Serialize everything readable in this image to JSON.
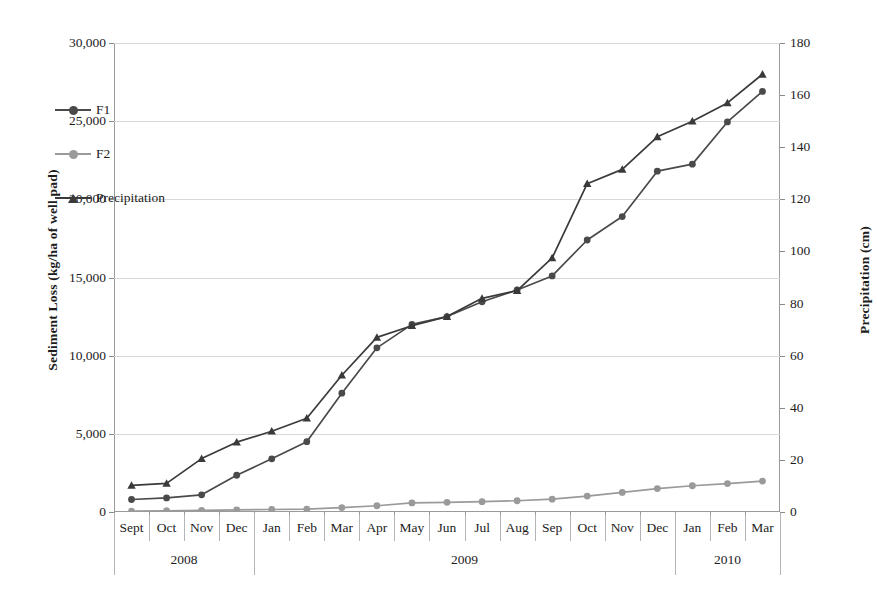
{
  "chart_data": {
    "type": "line",
    "title": "",
    "xlabel": "",
    "ylabel": "Sediment Loss (kg/ha of well pad)",
    "y2label": "Precipitation (cm)",
    "ylim": [
      0,
      30000
    ],
    "y2lim": [
      0,
      180
    ],
    "grid": true,
    "legend_position": "upper-left-inside",
    "categories": [
      "Sept",
      "Oct",
      "Nov",
      "Dec",
      "Jan",
      "Feb",
      "Mar",
      "Apr",
      "May",
      "Jun",
      "Jul",
      "Aug",
      "Sep",
      "Oct",
      "Nov",
      "Dec",
      "Jan",
      "Feb",
      "Mar"
    ],
    "year_groups": [
      {
        "label": "2008",
        "start": 0,
        "end": 3
      },
      {
        "label": "2009",
        "start": 4,
        "end": 15
      },
      {
        "label": "2010",
        "start": 16,
        "end": 18
      }
    ],
    "yticks": [
      "0",
      "5,000",
      "10,000",
      "15,000",
      "20,000",
      "25,000",
      "30,000"
    ],
    "ytick_values": [
      0,
      5000,
      10000,
      15000,
      20000,
      25000,
      30000
    ],
    "y2ticks": [
      "0",
      "20",
      "40",
      "60",
      "80",
      "100",
      "120",
      "140",
      "160",
      "180"
    ],
    "y2tick_values": [
      0,
      20,
      40,
      60,
      80,
      100,
      120,
      140,
      160,
      180
    ],
    "series": [
      {
        "name": "F1",
        "axis": "left",
        "marker": "circle",
        "color": "#4a4a4a",
        "values": [
          800,
          900,
          1100,
          2350,
          3400,
          4500,
          7600,
          10500,
          12000,
          12500,
          13450,
          14200,
          15100,
          17400,
          18900,
          21800,
          22250,
          24950,
          26900
        ]
      },
      {
        "name": "F2",
        "axis": "left",
        "marker": "circle",
        "color": "#9a9a9a",
        "values": [
          60,
          80,
          110,
          140,
          160,
          190,
          280,
          400,
          580,
          620,
          660,
          720,
          820,
          1020,
          1250,
          1500,
          1680,
          1820,
          1980
        ]
      },
      {
        "name": "Precipitation",
        "axis": "right",
        "marker": "triangle",
        "color": "#3a3a3a",
        "values": [
          10.2,
          11.0,
          20.5,
          26.8,
          31.0,
          36.0,
          52.5,
          67.0,
          71.5,
          75.0,
          82.0,
          85.0,
          97.5,
          126.0,
          131.5,
          144.0,
          150.0,
          157.0,
          168.0
        ]
      }
    ]
  },
  "legend": {
    "items": [
      {
        "label": "F1"
      },
      {
        "label": "F2"
      },
      {
        "label": "Precipitation"
      }
    ]
  }
}
